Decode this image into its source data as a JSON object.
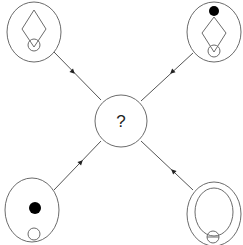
{
  "diagram": {
    "title": "",
    "center": {
      "label": "?",
      "shape": "ellipse",
      "cx": 121,
      "cy": 121,
      "rx": 26,
      "ry": 26
    },
    "nodes": [
      {
        "id": "top-left",
        "cx": 34,
        "cy": 32,
        "rx": 27,
        "ry": 30,
        "contents": [
          "diamond",
          "small-circle-bottom"
        ],
        "diamond": {
          "top": [
            34,
            10
          ],
          "right": [
            46,
            29
          ],
          "bottom": [
            34,
            47
          ],
          "left": [
            22,
            29
          ]
        },
        "small_circle": {
          "cx": 34,
          "cy": 45,
          "r": 6
        }
      },
      {
        "id": "top-right",
        "cx": 214,
        "cy": 32,
        "rx": 27,
        "ry": 30,
        "contents": [
          "black-dot-top",
          "diamond",
          "small-circle-bottom"
        ],
        "black_dot": {
          "cx": 214,
          "cy": 11,
          "r": 5
        },
        "diamond": {
          "top": [
            214,
            17
          ],
          "right": [
            226,
            33
          ],
          "bottom": [
            214,
            52
          ],
          "left": [
            202,
            33
          ]
        },
        "small_circle": {
          "cx": 214,
          "cy": 51,
          "r": 6
        }
      },
      {
        "id": "bottom-left",
        "cx": 32,
        "cy": 210,
        "rx": 27,
        "ry": 32,
        "contents": [
          "black-dot",
          "small-circle-bottom"
        ],
        "black_dot": {
          "cx": 35,
          "cy": 208,
          "r": 6
        },
        "small_circle": {
          "cx": 34,
          "cy": 234,
          "r": 6
        }
      },
      {
        "id": "bottom-right",
        "cx": 214,
        "cy": 214,
        "rx": 27,
        "ry": 32,
        "contents": [
          "inner-ellipse",
          "small-circle-with-line"
        ],
        "inner_ellipse": {
          "cx": 214,
          "cy": 212,
          "rx": 19,
          "ry": 24
        },
        "small_circle": {
          "cx": 213,
          "cy": 237,
          "r": 6
        }
      }
    ],
    "edges": [
      {
        "from": "top-left",
        "to": "center",
        "x1": 54,
        "y1": 52,
        "x2": 101,
        "y2": 100,
        "arrow_at": [
          73,
          72
        ],
        "direction": "toward-center"
      },
      {
        "from": "top-right",
        "to": "center",
        "x1": 193,
        "y1": 53,
        "x2": 141,
        "y2": 101,
        "arrow_at": [
          172,
          72
        ],
        "direction": "toward-center"
      },
      {
        "from": "bottom-left",
        "to": "center",
        "x1": 54,
        "y1": 190,
        "x2": 101,
        "y2": 141,
        "arrow_at": [
          81,
          162
        ],
        "direction": "toward-center"
      },
      {
        "from": "bottom-right",
        "to": "center",
        "x1": 193,
        "y1": 190,
        "x2": 141,
        "y2": 141,
        "arrow_at": [
          173,
          171
        ],
        "direction": "toward-center"
      }
    ],
    "colors": {
      "stroke": "#6b6b6b",
      "edge": "#555555",
      "fill_dot": "#000000",
      "background": "#ffffff"
    }
  }
}
